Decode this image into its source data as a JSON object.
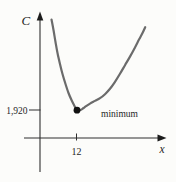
{
  "figure": {
    "background": "#fcfcfa",
    "y_axis_label": "C",
    "x_axis_label": "x",
    "y_tick_label": "1,920",
    "x_tick_label": "12",
    "annotation_label": "minimum"
  },
  "chart_data": {
    "type": "line",
    "title": "",
    "xlabel": "x",
    "ylabel": "C",
    "legend": false,
    "grid": false,
    "x_ticks": [
      {
        "value": 12,
        "label": "12"
      }
    ],
    "y_ticks": [
      {
        "value": 1920,
        "label": "1,920"
      }
    ],
    "minimum_point": {
      "x": 12,
      "y": 1920
    },
    "annotations": [
      {
        "text": "minimum",
        "x": 12,
        "y": 1920,
        "position": "right-of-point"
      }
    ],
    "axes": {
      "color": "#2f2f2f",
      "origin_px": [
        40,
        138
      ],
      "x_arrow": true,
      "y_arrow": true
    },
    "series": [
      {
        "name": "C",
        "color": "#6b6b6b",
        "stroke_width": 2.2,
        "points_estimated": [
          [
            3.9,
            8090
          ],
          [
            5.1,
            6580
          ],
          [
            6.6,
            5070
          ],
          [
            8.4,
            3700
          ],
          [
            10.4,
            2610
          ],
          [
            12,
            1920
          ],
          [
            15.1,
            2160
          ],
          [
            18.1,
            2550
          ],
          [
            21.4,
            3050
          ],
          [
            24.7,
            3940
          ],
          [
            27.9,
            5040
          ],
          [
            31.2,
            6210
          ],
          [
            34.5,
            7580
          ]
        ]
      }
    ],
    "marker": {
      "x": 12,
      "y": 1920,
      "shape": "filled-circle",
      "color": "#111111"
    },
    "render": {
      "curve_points_px": [
        [
          51.5,
          19.5
        ],
        [
          53.5,
          30
        ],
        [
          55.5,
          42
        ],
        [
          57.5,
          53
        ],
        [
          60,
          64
        ],
        [
          62.5,
          74
        ],
        [
          65.5,
          84
        ],
        [
          68.5,
          93
        ],
        [
          71.5,
          100
        ],
        [
          74,
          105
        ],
        [
          76.2,
          108.8
        ],
        [
          78.5,
          110.3
        ],
        [
          81,
          109.7
        ],
        [
          83.5,
          108
        ],
        [
          86,
          106.2
        ],
        [
          90,
          103.6
        ],
        [
          95,
          100.9
        ],
        [
          100,
          98.2
        ],
        [
          105,
          94.2
        ],
        [
          110,
          88.8
        ],
        [
          115,
          81.8
        ],
        [
          120,
          73.8
        ],
        [
          125,
          65.2
        ],
        [
          130,
          56.6
        ],
        [
          135,
          47.4
        ],
        [
          139,
          39.6
        ],
        [
          142.5,
          33
        ],
        [
          145.2,
          27.2
        ]
      ],
      "dot_px": [
        77,
        110.2
      ],
      "dot_r": 3.4
    }
  }
}
